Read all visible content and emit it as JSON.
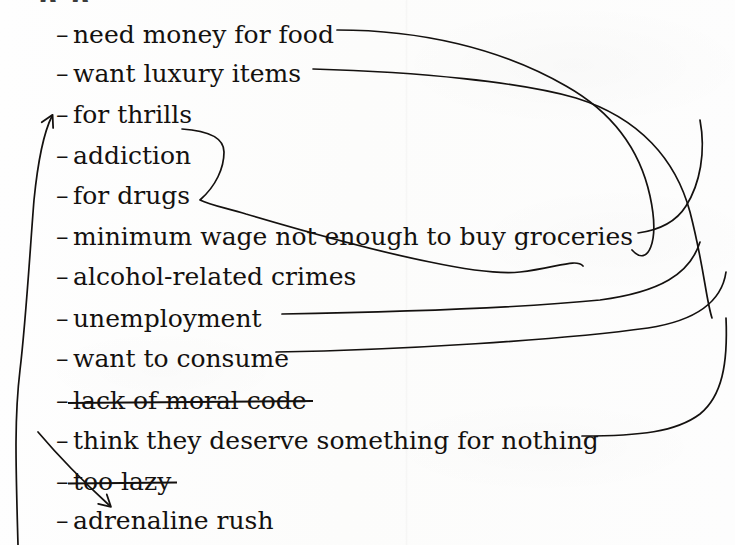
{
  "page": {
    "kind": "handwritten-brainstorm-list",
    "cropped_heading_fragment": "p                    p",
    "ink_color": "#14110f",
    "paper_color": "#fdfdfd"
  },
  "list": {
    "bullet": "–",
    "items": [
      {
        "id": "need-money-for-food",
        "label": "need money for food",
        "top": 22,
        "struck": false
      },
      {
        "id": "want-luxury-items",
        "label": "want luxury items",
        "top": 61,
        "struck": false
      },
      {
        "id": "for-thrills",
        "label": "for thrills",
        "top": 102,
        "struck": false
      },
      {
        "id": "addiction",
        "label": "addiction",
        "top": 143,
        "struck": false
      },
      {
        "id": "for-drugs",
        "label": "for drugs",
        "top": 183,
        "struck": false
      },
      {
        "id": "minimum-wage-not-enough-to-buy-groceries",
        "label": "minimum wage not enough to buy groceries",
        "top": 224,
        "struck": false
      },
      {
        "id": "alcohol-related-crimes",
        "label": "alcohol-related crimes",
        "top": 264,
        "struck": false
      },
      {
        "id": "unemployment",
        "label": "unemployment",
        "top": 306,
        "struck": false
      },
      {
        "id": "want-to-consume",
        "label": "want to consume",
        "top": 346,
        "struck": false
      },
      {
        "id": "lack-of-moral-code",
        "label": "lack of moral code",
        "top": 388,
        "struck": true
      },
      {
        "id": "think-they-deserve-something-for-nothing",
        "label": "think they deserve something for nothing",
        "top": 428,
        "struck": false
      },
      {
        "id": "too-lazy",
        "label": "too lazy",
        "top": 469,
        "struck": true
      },
      {
        "id": "adrenaline-rush",
        "label": "adrenaline rush",
        "top": 508,
        "struck": false
      }
    ]
  },
  "connectors": {
    "stroke_color": "#14110f",
    "stroke_width": 1.7,
    "paths": [
      {
        "id": "food-to-right",
        "from": "need-money-for-food",
        "to": "right-margin-down",
        "d": "M 337 30 C 420 30 500 48 566 86 C 612 112 640 150 650 196 C 660 242 648 268 632 250",
        "arrow": false
      },
      {
        "id": "luxury-to-right",
        "from": "want-luxury-items",
        "to": "right-margin-down",
        "d": "M 313 69 C 420 72 520 82 576 98 C 640 118 676 160 690 212 C 704 266 706 300 712 318",
        "arrow": false
      },
      {
        "id": "addiction-drugs-bracket",
        "from": "addiction-and-for-drugs",
        "to": "alcohol-related-crimes",
        "d": "M 182 129 C 212 131 224 140 224 152 C 224 168 216 186 200 200 C 212 206 228 208 246 214 C 300 230 380 252 430 262 C 468 270 500 274 520 272 C 556 268 576 258 583 266",
        "arrow": false
      },
      {
        "id": "groceries-to-right",
        "from": "minimum-wage-not-enough-to-buy-groceries",
        "to": "right-margin-down",
        "d": "M 638 233 C 660 230 676 222 686 206 C 700 184 706 152 700 120",
        "arrow": false
      },
      {
        "id": "unemployment-to-right",
        "from": "unemployment",
        "to": "right-margin-down",
        "d": "M 282 314 C 400 312 520 308 600 300 C 660 292 690 274 700 242",
        "arrow": false
      },
      {
        "id": "consume-to-right",
        "from": "want-to-consume",
        "to": "right-margin-down",
        "d": "M 276 352 C 400 350 560 340 648 328 C 700 320 722 300 726 272",
        "arrow": false
      },
      {
        "id": "deserve-to-right",
        "from": "think-they-deserve-something-for-nothing",
        "to": "right-margin-down",
        "d": "M 582 436 C 640 436 676 432 700 414 C 722 396 728 364 726 318",
        "arrow": false
      },
      {
        "id": "left-loop-to-for-thrills",
        "from": "left-margin-return",
        "to": "for-thrills",
        "d": "M 18 545 C 16 470 14 420 20 370 C 26 320 30 250 34 200 C 38 160 44 132 52 116",
        "arrow": true,
        "arrow_at": "for-thrills",
        "arrow_direction": "up-right"
      },
      {
        "id": "left-down-to-adrenaline-rush",
        "from": "left-margin-descender",
        "to": "adrenaline-rush",
        "d": "M 38 432 C 60 458 86 484 110 506",
        "arrow": true,
        "arrow_at": "adrenaline-rush",
        "arrow_direction": "down-right"
      }
    ]
  }
}
